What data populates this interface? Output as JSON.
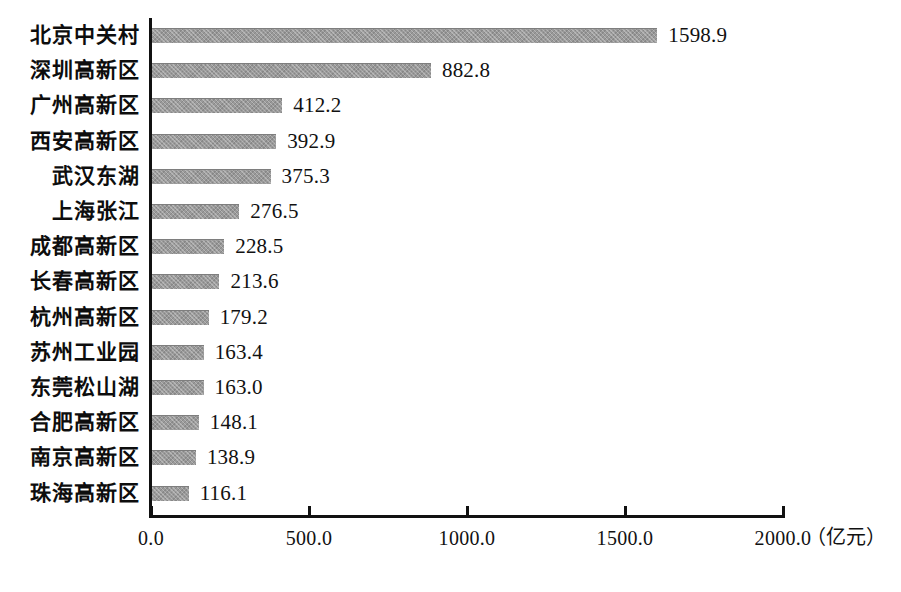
{
  "chart_data": {
    "type": "bar",
    "orientation": "horizontal",
    "title": "",
    "xlabel": "（亿元）",
    "ylabel": "",
    "xlim": [
      0,
      2000
    ],
    "xticks": [
      "0.0",
      "500.0",
      "1000.0",
      "1500.0",
      "2000.0"
    ],
    "xtick_values": [
      0,
      500,
      1000,
      1500,
      2000
    ],
    "grid": false,
    "legend": false,
    "bar_color": "#9a9a9a",
    "axis_color": "#111111",
    "categories": [
      "北京中关村",
      "深圳高新区",
      "广州高新区",
      "西安高新区",
      "武汉东湖",
      "上海张江",
      "成都高新区",
      "长春高新区",
      "杭州高新区",
      "苏州工业园",
      "东莞松山湖",
      "合肥高新区",
      "南京高新区",
      "珠海高新区"
    ],
    "values": [
      1598.9,
      882.8,
      412.2,
      392.9,
      375.3,
      276.5,
      228.5,
      213.6,
      179.2,
      163.4,
      163.0,
      148.1,
      138.9,
      116.1
    ],
    "value_labels": [
      "1598.9",
      "882.8",
      "412.2",
      "392.9",
      "375.3",
      "276.5",
      "228.5",
      "213.6",
      "179.2",
      "163.4",
      "163.0",
      "148.1",
      "138.9",
      "116.1"
    ]
  }
}
